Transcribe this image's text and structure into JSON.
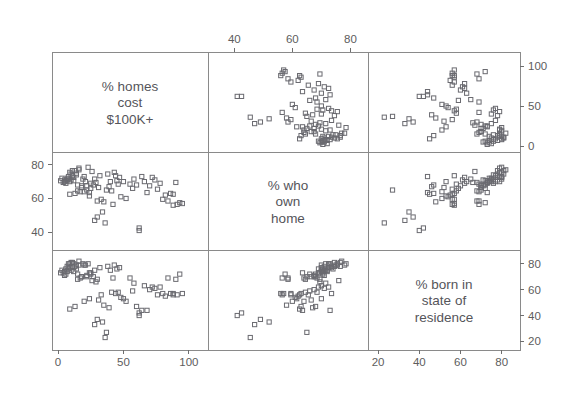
{
  "figure": {
    "kind": "scatterplot-matrix",
    "width": 582,
    "height": 403,
    "background": "#ffffff",
    "marker_color": "#6a6a70",
    "frame_color": "#8a8a8a",
    "text_color": "#55555a",
    "plot_area": {
      "left": 52,
      "top": 52,
      "right": 520,
      "bottom": 350
    },
    "dividers": {
      "vertical": [
        208,
        368
      ],
      "horizontal": [
        152,
        250
      ]
    }
  },
  "variables": [
    {
      "id": "homes",
      "label_lines": [
        "% homes",
        "cost",
        "$100K+"
      ],
      "range": [
        0,
        110
      ],
      "ticks": [
        0,
        50,
        100
      ],
      "tick_labels": [
        "0",
        "50",
        "100"
      ]
    },
    {
      "id": "own",
      "label_lines": [
        "% who",
        "own",
        "home"
      ],
      "range": [
        33,
        84
      ],
      "ticks": [
        40,
        60,
        80
      ],
      "tick_labels": [
        "40",
        "60",
        "80"
      ]
    },
    {
      "id": "born",
      "label_lines": [
        "% born in",
        "state of",
        "residence"
      ],
      "range": [
        18,
        86
      ],
      "ticks": [
        20,
        40,
        60,
        80
      ],
      "tick_labels": [
        "20",
        "40",
        "60",
        "80"
      ]
    }
  ],
  "axes": {
    "top": {
      "variable": "own",
      "ticks": [
        40,
        60,
        80
      ],
      "labels": [
        "40",
        "60",
        "80"
      ]
    },
    "right_upper": {
      "variable": "homes",
      "ticks": [
        0,
        50,
        100
      ],
      "labels": [
        "0",
        "50",
        "100"
      ]
    },
    "right_lower": {
      "variable": "born",
      "ticks": [
        20,
        40,
        60,
        80
      ],
      "labels": [
        "20",
        "40",
        "60",
        "80"
      ]
    },
    "left_middle": {
      "variable": "own",
      "ticks": [
        40,
        60,
        80
      ],
      "labels": [
        "40",
        "60",
        "80"
      ]
    },
    "bottom_left": {
      "variable": "homes",
      "ticks": [
        0,
        50,
        100
      ],
      "labels": [
        "0",
        "50",
        "100"
      ]
    },
    "bottom_right": {
      "variable": "born",
      "ticks": [
        20,
        40,
        60,
        80
      ],
      "labels": [
        "20",
        "40",
        "60",
        "80"
      ]
    }
  },
  "chart_data": {
    "type": "scatter",
    "title": "",
    "subtitle": "",
    "xlabel": "",
    "ylabel": "",
    "grid": false,
    "legend": "none",
    "matrix": {
      "rows": [
        "homes",
        "own",
        "born"
      ],
      "cols": [
        "homes",
        "own",
        "born"
      ],
      "diagonal": "variable-label",
      "panels": [
        {
          "row": 0,
          "col": 0,
          "type": "label",
          "variable": "homes"
        },
        {
          "row": 0,
          "col": 1,
          "type": "scatter",
          "x": "own",
          "y": "homes"
        },
        {
          "row": 0,
          "col": 2,
          "type": "scatter",
          "x": "born",
          "y": "homes"
        },
        {
          "row": 1,
          "col": 0,
          "type": "scatter",
          "x": "homes",
          "y": "own"
        },
        {
          "row": 1,
          "col": 1,
          "type": "label",
          "variable": "own"
        },
        {
          "row": 1,
          "col": 2,
          "type": "scatter",
          "x": "born",
          "y": "own"
        },
        {
          "row": 2,
          "col": 0,
          "type": "scatter",
          "x": "homes",
          "y": "born"
        },
        {
          "row": 2,
          "col": 1,
          "type": "scatter",
          "x": "own",
          "y": "born"
        },
        {
          "row": 2,
          "col": 2,
          "type": "label",
          "variable": "born"
        }
      ]
    },
    "observations": [
      {
        "homes": 42,
        "own": 56.5,
        "born": 69
      },
      {
        "homes": 30,
        "own": 58.5,
        "born": 68
      },
      {
        "homes": 93,
        "own": 57.5,
        "born": 72
      },
      {
        "homes": 84,
        "own": 58.5,
        "born": 69
      },
      {
        "homes": 62,
        "own": 41.0,
        "born": 40
      },
      {
        "homes": 25,
        "own": 66.0,
        "born": 72
      },
      {
        "homes": 18,
        "own": 67.5,
        "born": 70
      },
      {
        "homes": 12,
        "own": 70.5,
        "born": 74
      },
      {
        "homes": 10,
        "own": 71.0,
        "born": 75
      },
      {
        "homes": 9,
        "own": 70.0,
        "born": 77
      },
      {
        "homes": 8,
        "own": 71.5,
        "born": 76
      },
      {
        "homes": 7,
        "own": 72.0,
        "born": 74
      },
      {
        "homes": 11,
        "own": 73.5,
        "born": 78
      },
      {
        "homes": 14,
        "own": 74.0,
        "born": 76
      },
      {
        "homes": 16,
        "own": 78.0,
        "born": 79
      },
      {
        "homes": 13,
        "own": 76.5,
        "born": 78
      },
      {
        "homes": 6,
        "own": 70.5,
        "born": 72
      },
      {
        "homes": 5,
        "own": 71.0,
        "born": 71
      },
      {
        "homes": 4,
        "own": 69.5,
        "born": 73
      },
      {
        "homes": 15,
        "own": 64.5,
        "born": 68
      },
      {
        "homes": 17,
        "own": 64.0,
        "born": 69
      },
      {
        "homes": 22,
        "own": 65.0,
        "born": 70
      },
      {
        "homes": 24,
        "own": 63.5,
        "born": 73
      },
      {
        "homes": 21,
        "own": 70.0,
        "born": 79
      },
      {
        "homes": 26,
        "own": 76.0,
        "born": 67
      },
      {
        "homes": 29,
        "own": 69.5,
        "born": 66
      },
      {
        "homes": 33,
        "own": 59.5,
        "born": 56
      },
      {
        "homes": 35,
        "own": 58.0,
        "born": 48
      },
      {
        "homes": 37,
        "own": 65.0,
        "born": 27
      },
      {
        "homes": 44,
        "own": 73.5,
        "born": 57
      },
      {
        "homes": 46,
        "own": 68.5,
        "born": 58
      },
      {
        "homes": 52,
        "own": 60.0,
        "born": 51
      },
      {
        "homes": 55,
        "own": 68.5,
        "born": 69
      },
      {
        "homes": 64,
        "own": 73.0,
        "born": 44
      },
      {
        "homes": 62,
        "own": 42.5,
        "born": 42
      },
      {
        "homes": 78,
        "own": 69.0,
        "born": 62
      },
      {
        "homes": 80,
        "own": 59.5,
        "born": 57
      },
      {
        "homes": 82,
        "own": 62.0,
        "born": 55
      },
      {
        "homes": 88,
        "own": 62.5,
        "born": 56
      },
      {
        "homes": 90,
        "own": 69.5,
        "born": 68
      },
      {
        "homes": 91,
        "own": 56.5,
        "born": 56
      },
      {
        "homes": 2,
        "own": 70.5,
        "born": 73
      },
      {
        "homes": 3,
        "own": 72.0,
        "born": 75
      },
      {
        "homes": 19,
        "own": 71.5,
        "born": 80
      },
      {
        "homes": 20,
        "own": 73.0,
        "born": 79
      },
      {
        "homes": 23,
        "own": 78.5,
        "born": 80
      },
      {
        "homes": 27,
        "own": 68.0,
        "born": 70
      },
      {
        "homes": 31,
        "own": 66.5,
        "born": 52
      },
      {
        "homes": 39,
        "own": 67.0,
        "born": 46
      },
      {
        "homes": 41,
        "own": 64.5,
        "born": 58
      },
      {
        "homes": 48,
        "own": 61.0,
        "born": 54
      },
      {
        "homes": 50,
        "own": 70.0,
        "born": 53
      },
      {
        "homes": 57,
        "own": 66.0,
        "born": 59
      },
      {
        "homes": 60,
        "own": 68.0,
        "born": 47
      },
      {
        "homes": 68,
        "own": 63.5,
        "born": 44
      },
      {
        "homes": 70,
        "own": 67.5,
        "born": 60
      },
      {
        "homes": 74,
        "own": 71.0,
        "born": 61
      },
      {
        "homes": 76,
        "own": 65.5,
        "born": 56
      },
      {
        "homes": 86,
        "own": 63.0,
        "born": 57
      },
      {
        "homes": 34,
        "own": 52.0,
        "born": 35
      },
      {
        "homes": 36,
        "own": 45.5,
        "born": 23
      },
      {
        "homes": 28,
        "own": 47.0,
        "born": 33
      },
      {
        "homes": 30,
        "own": 49.0,
        "born": 37
      },
      {
        "homes": 13,
        "own": 63.0,
        "born": 47
      },
      {
        "homes": 20,
        "own": 64.0,
        "born": 51
      },
      {
        "homes": 24,
        "own": 61.5,
        "born": 53
      },
      {
        "homes": 9,
        "own": 62.5,
        "born": 45
      },
      {
        "homes": 45,
        "own": 70.5,
        "born": 76
      },
      {
        "homes": 47,
        "own": 72.5,
        "born": 77
      },
      {
        "homes": 40,
        "own": 70.0,
        "born": 75
      },
      {
        "homes": 38,
        "own": 74.5,
        "born": 78
      },
      {
        "homes": 43,
        "own": 75.5,
        "born": 79
      },
      {
        "homes": 12,
        "own": 72.5,
        "born": 80
      },
      {
        "homes": 10,
        "own": 74.5,
        "born": 81
      },
      {
        "homes": 8,
        "own": 73.0,
        "born": 80
      },
      {
        "homes": 7,
        "own": 71.0,
        "born": 78
      },
      {
        "homes": 6,
        "own": 69.0,
        "born": 76
      },
      {
        "homes": 5,
        "own": 70.0,
        "born": 74
      },
      {
        "homes": 15,
        "own": 68.0,
        "born": 72
      },
      {
        "homes": 18,
        "own": 66.5,
        "born": 70
      },
      {
        "homes": 22,
        "own": 67.5,
        "born": 71
      },
      {
        "homes": 25,
        "own": 69.0,
        "born": 73
      },
      {
        "homes": 28,
        "own": 71.5,
        "born": 75
      },
      {
        "homes": 32,
        "own": 73.5,
        "born": 77
      },
      {
        "homes": 14,
        "own": 75.0,
        "born": 79
      },
      {
        "homes": 11,
        "own": 76.5,
        "born": 81
      },
      {
        "homes": 16,
        "own": 77.0,
        "born": 82
      },
      {
        "homes": 9,
        "own": 75.5,
        "born": 80
      },
      {
        "homes": 95,
        "own": 57.0,
        "born": 57
      },
      {
        "homes": 88,
        "own": 56.0,
        "born": 57
      },
      {
        "homes": 72,
        "own": 72.5,
        "born": 62
      },
      {
        "homes": 66,
        "own": 70.0,
        "born": 63
      },
      {
        "homes": 58,
        "own": 71.5,
        "born": 65
      }
    ]
  }
}
